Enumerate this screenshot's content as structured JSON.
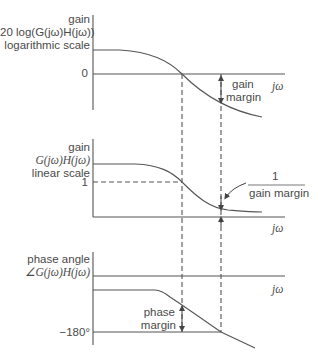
{
  "plots": {
    "top": {
      "ylabel_line1": "gain",
      "ylabel_line2": "20 log(G(jω)H(jω))",
      "ylabel_line3": "logarithmic scale",
      "tick_zero": "0",
      "xlabel": "jω",
      "annotation_line1": "gain",
      "annotation_line2": "margin"
    },
    "middle": {
      "ylabel_line1": "gain",
      "ylabel_line2": "G(jω)H(jω)",
      "ylabel_line3": "linear scale",
      "tick_one": "1",
      "xlabel": "jω",
      "annotation_numerator": "1",
      "annotation_denominator": "gain margin"
    },
    "bottom": {
      "ylabel_line1": "phase angle",
      "ylabel_line2": "∠G(jω)H(jω)",
      "tick_minus180": "−180°",
      "xlabel": "jω",
      "annotation_line1": "phase",
      "annotation_line2": "margin"
    }
  },
  "colors": {
    "line": "#555555",
    "text": "#4a4a4a"
  }
}
